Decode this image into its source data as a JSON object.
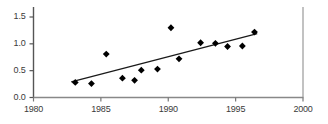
{
  "chart_data": {
    "type": "scatter",
    "title": "",
    "subtitle": "",
    "xlabel": "",
    "ylabel": "",
    "xlim": [
      1980,
      2000
    ],
    "ylim": [
      0.0,
      1.5
    ],
    "grid": false,
    "legend": "none",
    "x_ticks": [
      1980,
      1985,
      1990,
      1995,
      2000
    ],
    "x_tick_labels": [
      "1980",
      "1985",
      "1990",
      "1995",
      "2000"
    ],
    "y_ticks": [
      0.0,
      0.5,
      1.0,
      1.5
    ],
    "y_tick_labels": [
      "0.0",
      "0.5",
      "1.0",
      "1.5"
    ],
    "marker": "diamond",
    "marker_color": "#000000",
    "points": [
      {
        "x": 1983.1,
        "y": 0.28
      },
      {
        "x": 1984.3,
        "y": 0.26
      },
      {
        "x": 1985.4,
        "y": 0.81
      },
      {
        "x": 1986.6,
        "y": 0.36
      },
      {
        "x": 1987.5,
        "y": 0.32
      },
      {
        "x": 1988.0,
        "y": 0.51
      },
      {
        "x": 1989.2,
        "y": 0.53
      },
      {
        "x": 1990.2,
        "y": 1.3
      },
      {
        "x": 1990.8,
        "y": 0.72
      },
      {
        "x": 1992.4,
        "y": 1.02
      },
      {
        "x": 1993.5,
        "y": 1.01
      },
      {
        "x": 1994.4,
        "y": 0.95
      },
      {
        "x": 1995.5,
        "y": 0.96
      },
      {
        "x": 1996.4,
        "y": 1.22
      }
    ],
    "trendline": {
      "name": "linear fit",
      "color": "#1a1a1a",
      "x_start": 1982.8,
      "y_start": 0.29,
      "x_end": 1996.6,
      "y_end": 1.19
    }
  }
}
